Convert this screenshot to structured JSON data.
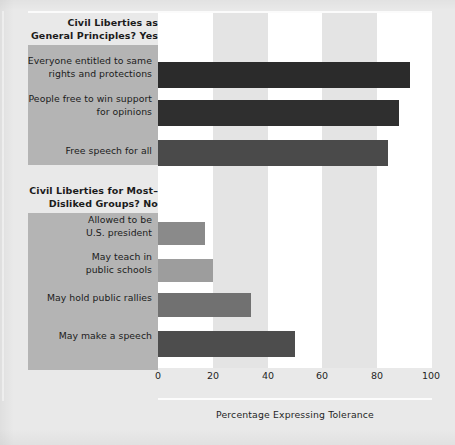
{
  "chart_data": {
    "type": "bar",
    "orientation": "horizontal",
    "title": "",
    "xlabel": "Percentage Expressing Tolerance",
    "ylabel": "",
    "xlim": [
      0,
      100
    ],
    "xticks": [
      0,
      20,
      40,
      60,
      80,
      100
    ],
    "xtick_labels": [
      "0",
      "20",
      "40",
      "60",
      "80",
      "100"
    ],
    "grid": false,
    "background_bands": "alternating white / light gray every 20 units",
    "legend": "none",
    "groups": [
      {
        "heading": "Civil Liberties as\nGeneral Principles? Yes",
        "heading_line1": "Civil Liberties as",
        "heading_line2": "General Principles? Yes",
        "items": [
          {
            "label_line1": "Everyone entitled to same",
            "label_line2": "rights and protections",
            "value": 92,
            "color": "#2b2b2b"
          },
          {
            "label_line1": "People free to win support",
            "label_line2": "for opinions",
            "value": 88,
            "color": "#2f2f2f"
          },
          {
            "label_line1": "Free speech for all",
            "label_line2": "",
            "value": 84,
            "color": "#4a4a4a"
          }
        ]
      },
      {
        "heading": "Civil Liberties for Most-\nDisliked Groups? No",
        "heading_line1": "Civil Liberties for Most–",
        "heading_line2": "Disliked Groups? No",
        "items": [
          {
            "label_line1": "Allowed to be",
            "label_line2": "U.S. president",
            "value": 17,
            "color": "#8a8a8a"
          },
          {
            "label_line1": "May teach in",
            "label_line2": "public schools",
            "value": 20,
            "color": "#9d9d9d"
          },
          {
            "label_line1": "May hold public rallies",
            "label_line2": "",
            "value": 34,
            "color": "#717171"
          },
          {
            "label_line1": "May make a speech",
            "label_line2": "",
            "value": 50,
            "color": "#4d4d4d"
          }
        ]
      }
    ],
    "categories": [
      "Everyone entitled to same rights and protections",
      "People free to win support for opinions",
      "Free speech for all",
      "Allowed to be U.S. president",
      "May teach in public schools",
      "May hold public rallies",
      "May make a speech"
    ],
    "values": [
      92,
      88,
      84,
      17,
      20,
      34,
      50
    ]
  },
  "figure": {
    "background_color": "#e9e9e9",
    "label_box_color": "#b4b4b4",
    "band_light_color": "#ffffff",
    "band_dark_color": "#e4e4e4",
    "text_color": "#1b1b1b"
  },
  "geometry": {
    "bars": [
      {
        "top": 49,
        "height": 26
      },
      {
        "top": 87,
        "height": 26
      },
      {
        "top": 127,
        "height": 26
      },
      {
        "top": 209,
        "height": 23
      },
      {
        "top": 246,
        "height": 23
      },
      {
        "top": 280,
        "height": 24
      },
      {
        "top": 318,
        "height": 26
      }
    ],
    "label_boxes": [
      {
        "left": 28,
        "top": 45,
        "width": 130,
        "height": 120
      },
      {
        "left": 28,
        "top": 213,
        "width": 130,
        "height": 157
      }
    ],
    "group_headings": [
      {
        "left": 22,
        "top": 16,
        "width": 136
      },
      {
        "left": 22,
        "top": 184,
        "width": 136
      }
    ],
    "bar_labels": [
      {
        "top": 55
      },
      {
        "top": 93
      },
      {
        "top": 145
      },
      {
        "top": 214
      },
      {
        "top": 251
      },
      {
        "top": 292
      },
      {
        "top": 330
      }
    ],
    "tick_positions": [
      158,
      213,
      268,
      322,
      377,
      431
    ]
  }
}
